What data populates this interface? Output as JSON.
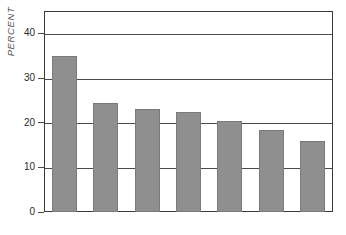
{
  "chart_data": {
    "type": "bar",
    "title": "",
    "subtitle": "",
    "xlabel": "",
    "ylabel": "PERCENT",
    "ylim": [
      0,
      45
    ],
    "yticks": [
      0,
      10,
      20,
      30,
      40
    ],
    "ytick_labels": [
      "0",
      "10",
      "20",
      "30",
      "40"
    ],
    "grid": true,
    "legend": null,
    "bar_color": "#8f8f8f",
    "categories": [
      "JAPAN",
      "W GERMANY",
      "CANADA",
      "FRANCE",
      "ITALY",
      "UNITED KINGDOM",
      "UNITED STATES"
    ],
    "category_lines": [
      [
        "JAPAN"
      ],
      [
        "W GERMANY"
      ],
      [
        "CANADA"
      ],
      [
        "FRANCE"
      ],
      [
        "ITALY"
      ],
      [
        "UNITED",
        "KINGDOM"
      ],
      [
        "UNITED",
        "STATES"
      ]
    ],
    "values": [
      34.9,
      24.5,
      23.1,
      22.3,
      20.3,
      18.4,
      15.8
    ]
  },
  "axis": {
    "y_title": "PERCENT"
  }
}
